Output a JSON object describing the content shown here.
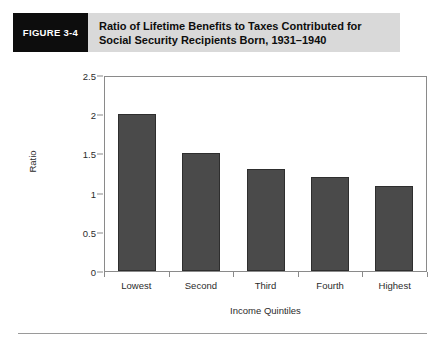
{
  "figure": {
    "number_label": "FIGURE 3-4",
    "title_line_1": "Ratio of Lifetime Benefits to Taxes Contributed for",
    "title_line_2": "Social Security Recipients Born, 1931–1940",
    "header_bg": "#d9d9d9",
    "number_box_bg": "#0d0d0d"
  },
  "chart_data": {
    "type": "bar",
    "title": "Ratio of Lifetime Benefits to Taxes Contributed for Social Security Recipients Born, 1931–1940",
    "categories": [
      "Lowest",
      "Second",
      "Third",
      "Fourth",
      "Highest"
    ],
    "values": [
      2.0,
      1.5,
      1.3,
      1.2,
      1.08
    ],
    "xlabel": "Income Quintiles",
    "ylabel": "Ratio",
    "ylim": [
      0,
      2.5
    ],
    "yticks": [
      0,
      0.5,
      1,
      1.5,
      2,
      2.5
    ],
    "ytick_labels": [
      "0",
      "0.5",
      "1",
      "1.5",
      "2",
      "2.5"
    ],
    "grid": false,
    "legend": "none",
    "bar_color": "#4a4a4a",
    "bar_edge_color": "#2e2e2e",
    "axis_color": "#8a8a8a"
  }
}
